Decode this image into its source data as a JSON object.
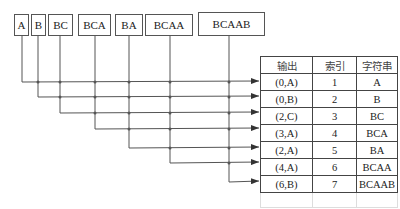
{
  "diagram": {
    "input_boxes": [
      {
        "label": "A"
      },
      {
        "label": "B"
      },
      {
        "label": "BC"
      },
      {
        "label": "BCA"
      },
      {
        "label": "BA"
      },
      {
        "label": "BCAA"
      },
      {
        "label": "BCAAB"
      }
    ],
    "table": {
      "headers": [
        "输出",
        "索引",
        "字符串"
      ],
      "rows": [
        {
          "output": "(0,A)",
          "index": "1",
          "string": "A"
        },
        {
          "output": "(0,B)",
          "index": "2",
          "string": "B"
        },
        {
          "output": "(2,C)",
          "index": "3",
          "string": "BC"
        },
        {
          "output": "(3,A)",
          "index": "4",
          "string": "BCA"
        },
        {
          "output": "(2,A)",
          "index": "5",
          "string": "BA"
        },
        {
          "output": "(4,A)",
          "index": "6",
          "string": "BCAA"
        },
        {
          "output": "(6,B)",
          "index": "7",
          "string": "BCAAB"
        }
      ]
    },
    "colors": {
      "line": "#555555",
      "border": "#444444"
    }
  }
}
